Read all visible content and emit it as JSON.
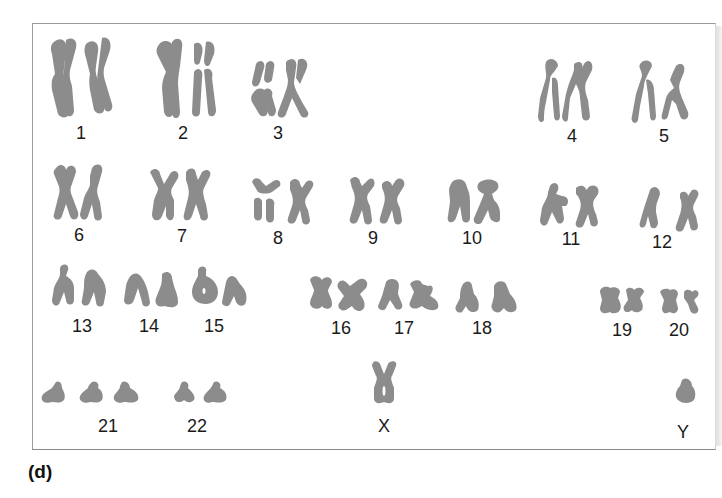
{
  "figure": {
    "panel_label": "(d)",
    "chromosome_color": "#8c8c8c",
    "frame_color": "#9a9a9a"
  },
  "karyotype": {
    "rows": [
      {
        "row": 1,
        "groups": [
          {
            "label": "1",
            "copies": 2
          },
          {
            "label": "2",
            "copies": 2
          },
          {
            "label": "3",
            "copies": 2
          },
          {
            "label": "4",
            "copies": 2
          },
          {
            "label": "5",
            "copies": 2
          }
        ]
      },
      {
        "row": 2,
        "groups": [
          {
            "label": "6",
            "copies": 2
          },
          {
            "label": "7",
            "copies": 2
          },
          {
            "label": "8",
            "copies": 2
          },
          {
            "label": "9",
            "copies": 2
          },
          {
            "label": "10",
            "copies": 2
          },
          {
            "label": "11",
            "copies": 2
          },
          {
            "label": "12",
            "copies": 2
          }
        ]
      },
      {
        "row": 3,
        "groups": [
          {
            "label": "13",
            "copies": 2
          },
          {
            "label": "14",
            "copies": 2
          },
          {
            "label": "15",
            "copies": 2
          },
          {
            "label": "16",
            "copies": 2
          },
          {
            "label": "17",
            "copies": 2
          },
          {
            "label": "18",
            "copies": 2
          },
          {
            "label": "19",
            "copies": 2
          },
          {
            "label": "20",
            "copies": 2
          }
        ]
      },
      {
        "row": 4,
        "groups": [
          {
            "label": "21",
            "copies": 3
          },
          {
            "label": "22",
            "copies": 2
          },
          {
            "label": "X",
            "copies": 1
          },
          {
            "label": "Y",
            "copies": 1
          }
        ]
      }
    ]
  }
}
